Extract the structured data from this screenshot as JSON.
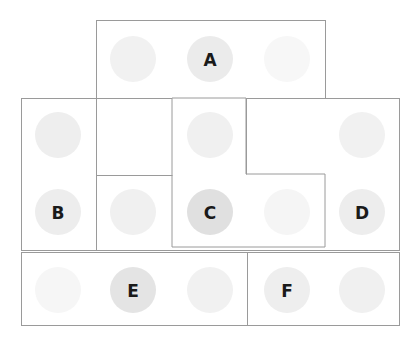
{
  "diagram": {
    "canvas": {
      "width": 418,
      "height": 340,
      "background": "#ffffff"
    },
    "style": {
      "border_color": "#9a9a9a",
      "border_width": 1,
      "rect_fill": "#ffffff",
      "circle_radius": 23,
      "label_color": "#1a1a1a",
      "circle_shade_light": "#f7f7f7",
      "circle_shade_mid": "#f0f0f0",
      "circle_shade_medium": "#ebebeb",
      "circle_shade_dark": "#e0e0e0"
    },
    "regions": [
      {
        "name": "top-region",
        "kind": "rect",
        "x": 96,
        "y": 20,
        "width": 229,
        "height": 78,
        "stroke": "#9a9a9a",
        "fill": "#ffffff"
      },
      {
        "name": "left-region",
        "kind": "rect",
        "x": 21,
        "y": 98,
        "width": 75,
        "height": 152,
        "stroke": "#9a9a9a",
        "fill": "#ffffff"
      },
      {
        "name": "middle-outer-region",
        "kind": "rect",
        "x": 21,
        "y": 98,
        "width": 378,
        "height": 152,
        "stroke": "#9a9a9a",
        "fill": "none"
      },
      {
        "name": "center-notched-region",
        "kind": "path",
        "path": "M 172 98 L 246 98 L 246 174 L 325 174 L 325 247 L 172 247 Z",
        "stroke": "#9a9a9a",
        "fill": "#ffffff"
      },
      {
        "name": "inner-divider-horizontal",
        "kind": "line",
        "x1": 96,
        "y1": 175,
        "x2": 172,
        "y2": 175,
        "stroke": "#9a9a9a"
      },
      {
        "name": "center-top-right-line",
        "kind": "line",
        "x1": 246,
        "y1": 98,
        "x2": 246,
        "y2": 174,
        "stroke": "#9a9a9a"
      },
      {
        "name": "bottom-region",
        "kind": "rect",
        "x": 21,
        "y": 252,
        "width": 378,
        "height": 73,
        "stroke": "#9a9a9a",
        "fill": "#ffffff"
      },
      {
        "name": "bottom-divider-vertical",
        "kind": "line",
        "x1": 247,
        "y1": 252,
        "x2": 247,
        "y2": 325,
        "stroke": "#9a9a9a"
      }
    ],
    "circles": [
      {
        "name": "circle-r1c2",
        "cx": 133,
        "cy": 59,
        "r": 23,
        "fill": "#f1f1f1",
        "label": ""
      },
      {
        "name": "circle-a",
        "cx": 210,
        "cy": 59,
        "r": 23,
        "fill": "#ebebeb",
        "label": "A"
      },
      {
        "name": "circle-r1c4",
        "cx": 287,
        "cy": 59,
        "r": 23,
        "fill": "#f7f7f7",
        "label": ""
      },
      {
        "name": "circle-r2c1",
        "cx": 58,
        "cy": 135,
        "r": 23,
        "fill": "#eeeeee",
        "label": ""
      },
      {
        "name": "circle-r2c3",
        "cx": 210,
        "cy": 135,
        "r": 23,
        "fill": "#f0f0f0",
        "label": ""
      },
      {
        "name": "circle-r2c5",
        "cx": 362,
        "cy": 135,
        "r": 23,
        "fill": "#f1f1f1",
        "label": ""
      },
      {
        "name": "circle-b",
        "cx": 58,
        "cy": 212,
        "r": 23,
        "fill": "#ededed",
        "label": "B"
      },
      {
        "name": "circle-r3c2",
        "cx": 133,
        "cy": 212,
        "r": 23,
        "fill": "#f0f0f0",
        "label": ""
      },
      {
        "name": "circle-c",
        "cx": 210,
        "cy": 212,
        "r": 23,
        "fill": "#e0e0e0",
        "label": "C"
      },
      {
        "name": "circle-r3c4",
        "cx": 287,
        "cy": 212,
        "r": 23,
        "fill": "#f5f5f5",
        "label": ""
      },
      {
        "name": "circle-d",
        "cx": 362,
        "cy": 212,
        "r": 23,
        "fill": "#ededed",
        "label": "D"
      },
      {
        "name": "circle-r4c1",
        "cx": 58,
        "cy": 290,
        "r": 23,
        "fill": "#f6f6f6",
        "label": ""
      },
      {
        "name": "circle-e",
        "cx": 133,
        "cy": 290,
        "r": 23,
        "fill": "#e4e4e4",
        "label": "E"
      },
      {
        "name": "circle-r4c3",
        "cx": 210,
        "cy": 290,
        "r": 23,
        "fill": "#f1f1f1",
        "label": ""
      },
      {
        "name": "circle-f",
        "cx": 287,
        "cy": 290,
        "r": 23,
        "fill": "#eeeeee",
        "label": "F"
      },
      {
        "name": "circle-r4c5",
        "cx": 362,
        "cy": 290,
        "r": 23,
        "fill": "#f0f0f0",
        "label": ""
      }
    ]
  }
}
